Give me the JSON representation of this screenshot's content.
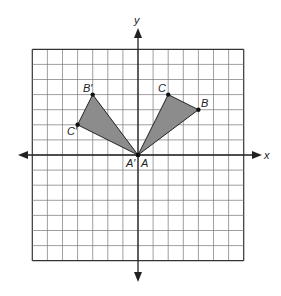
{
  "diagram": {
    "type": "coordinate-grid-rotation",
    "axes": {
      "x_label": "x",
      "y_label": "y"
    },
    "grid": {
      "xmin": -7,
      "xmax": 7,
      "ymin": -7,
      "ymax": 7
    },
    "triangle_original": {
      "vertices": [
        {
          "name": "A",
          "x": 0,
          "y": 0
        },
        {
          "name": "B",
          "x": 4,
          "y": 3
        },
        {
          "name": "C",
          "x": 2,
          "y": 4
        }
      ]
    },
    "triangle_image": {
      "vertices": [
        {
          "name": "A′",
          "x": 0,
          "y": 0
        },
        {
          "name": "B′",
          "x": -3,
          "y": 4
        },
        {
          "name": "C′",
          "x": -4,
          "y": 2
        }
      ]
    },
    "labels": {
      "A": "A",
      "A_prime": "A′",
      "B": "B",
      "B_prime": "B′",
      "C": "C",
      "C_prime": "C′"
    },
    "fill_color": "#8c8c8c"
  }
}
